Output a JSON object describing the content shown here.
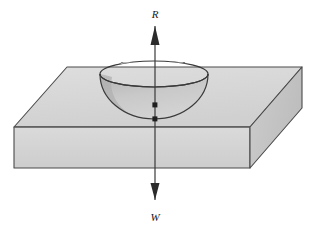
{
  "figure": {
    "background_color": "#ffffff",
    "outline_color": "#3a3a3a"
  },
  "labels": {
    "reaction": "R",
    "weight": "W"
  },
  "force_arrows": {
    "up_arrow": {
      "name": "reaction-force-arrow",
      "direction": "up",
      "label": "R",
      "tip_y": 26,
      "tail_y": 200
    },
    "down_arrow": {
      "name": "weight-force-arrow",
      "direction": "down",
      "label": "W",
      "tip_y": 200,
      "tail_y": 26
    },
    "axis_x": 155,
    "axis_color": "#3a3a3a"
  },
  "point_markers": [
    {
      "name": "centre-of-mass-point",
      "x": 155,
      "y": 105
    },
    {
      "name": "contact-point",
      "x": 155,
      "y": 119
    }
  ],
  "slab": {
    "name": "slab-block",
    "top_face_color": "#d8d8d8",
    "front_face_color": "#d2d2d2",
    "right_face_color": "#c4c4c4",
    "edge_color": "#4a4a4a"
  },
  "bowl": {
    "name": "bowl-depression",
    "rim_color": "#3a3a3a",
    "inner_color": "#cacaca",
    "shadow_color": "#b4b4b4",
    "rim_left_x": 100,
    "rim_right_x": 208,
    "rim_y": 74,
    "bottom_y": 119
  },
  "spheres": [
    {
      "name": "sphere-left",
      "cx": 130,
      "cy": 76,
      "r": 16,
      "base_color": "#9a9a9a",
      "highlight_color": "#cfcfcf",
      "shadow_color": "#5e5e5e"
    },
    {
      "name": "sphere-right",
      "cx": 176,
      "cy": 76,
      "r": 16,
      "base_color": "#9a9a9a",
      "highlight_color": "#cfcfcf",
      "shadow_color": "#5e5e5e"
    }
  ]
}
